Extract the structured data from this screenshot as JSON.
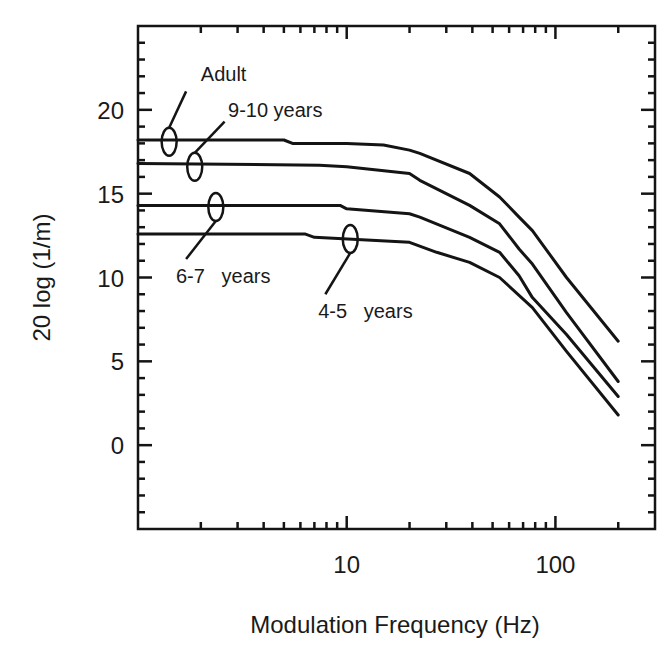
{
  "chart_data": {
    "type": "line",
    "title": "",
    "xlabel": "Modulation Frequency (Hz)",
    "ylabel": "20 log (1/m)",
    "xscale": "log",
    "xlim": [
      1,
      300
    ],
    "ylim": [
      -5,
      25
    ],
    "grid": false,
    "legend": "none (curves labeled by annotations)",
    "x_tick_labels": [
      {
        "value": 10,
        "label": "10"
      },
      {
        "value": 100,
        "label": "100"
      }
    ],
    "x_minor_ticks": [
      2,
      3,
      4,
      5,
      6,
      7,
      8,
      9,
      20,
      30,
      40,
      50,
      60,
      70,
      80,
      90,
      200
    ],
    "y_tick_labels": [
      {
        "value": 0,
        "label": "0"
      },
      {
        "value": 5,
        "label": "5"
      },
      {
        "value": 10,
        "label": "10"
      },
      {
        "value": 15,
        "label": "15"
      },
      {
        "value": 20,
        "label": "20"
      }
    ],
    "y_minor_step": 1,
    "series": [
      {
        "name": "Adult",
        "points": [
          [
            1,
            18.2
          ],
          [
            5,
            18.2
          ],
          [
            5.5,
            18.0
          ],
          [
            10,
            18.0
          ],
          [
            15,
            17.9
          ],
          [
            20,
            17.6
          ],
          [
            22.4,
            17.4
          ],
          [
            38.8,
            16.2
          ],
          [
            54,
            14.8
          ],
          [
            67,
            13.6
          ],
          [
            77.6,
            12.8
          ],
          [
            113,
            10.0
          ],
          [
            200,
            6.2
          ]
        ]
      },
      {
        "name": "9-10 years",
        "points": [
          [
            1,
            16.8
          ],
          [
            7.4,
            16.7
          ],
          [
            10,
            16.6
          ],
          [
            20,
            16.2
          ],
          [
            22.4,
            15.8
          ],
          [
            38.8,
            14.3
          ],
          [
            54,
            13.2
          ],
          [
            67,
            11.7
          ],
          [
            77.6,
            10.8
          ],
          [
            113,
            7.9
          ],
          [
            200,
            3.8
          ]
        ]
      },
      {
        "name": "6-7 years",
        "points": [
          [
            1,
            14.3
          ],
          [
            9.3,
            14.3
          ],
          [
            10,
            14.1
          ],
          [
            20,
            13.8
          ],
          [
            22.4,
            13.6
          ],
          [
            38.8,
            12.4
          ],
          [
            54,
            11.5
          ],
          [
            67,
            10.1
          ],
          [
            77.6,
            8.8
          ],
          [
            113,
            6.6
          ],
          [
            200,
            2.9
          ]
        ]
      },
      {
        "name": "4-5 years",
        "points": [
          [
            1,
            12.6
          ],
          [
            6.3,
            12.6
          ],
          [
            7,
            12.4
          ],
          [
            20,
            12.1
          ],
          [
            27,
            11.5
          ],
          [
            38.8,
            10.9
          ],
          [
            54,
            10.0
          ],
          [
            77.6,
            8.2
          ],
          [
            113,
            5.6
          ],
          [
            200,
            1.8
          ]
        ]
      }
    ],
    "annotations": [
      {
        "text": "Adult",
        "series": "Adult",
        "marker_at": [
          1.41,
          18.1
        ],
        "text_at": [
          2.0,
          21.7
        ],
        "leader_to": [
          1.7,
          21.1
        ],
        "align": "start"
      },
      {
        "text": "9-10 years",
        "series": "9-10 years",
        "marker_at": [
          1.87,
          16.6
        ],
        "text_at": [
          2.7,
          19.6
        ],
        "leader_to": [
          2.6,
          19.3
        ],
        "align": "start"
      },
      {
        "text": "6-7   years",
        "series": "6-7 years",
        "marker_at": [
          2.36,
          14.2
        ],
        "text_at": [
          1.52,
          9.7
        ],
        "leader_to": [
          1.7,
          11.1
        ],
        "align": "start"
      },
      {
        "text": "4-5   years",
        "series": "4-5 years",
        "marker_at": [
          10.4,
          12.3
        ],
        "text_at": [
          7.3,
          7.6
        ],
        "leader_to": [
          7.9,
          9.0
        ],
        "align": "start"
      }
    ]
  }
}
